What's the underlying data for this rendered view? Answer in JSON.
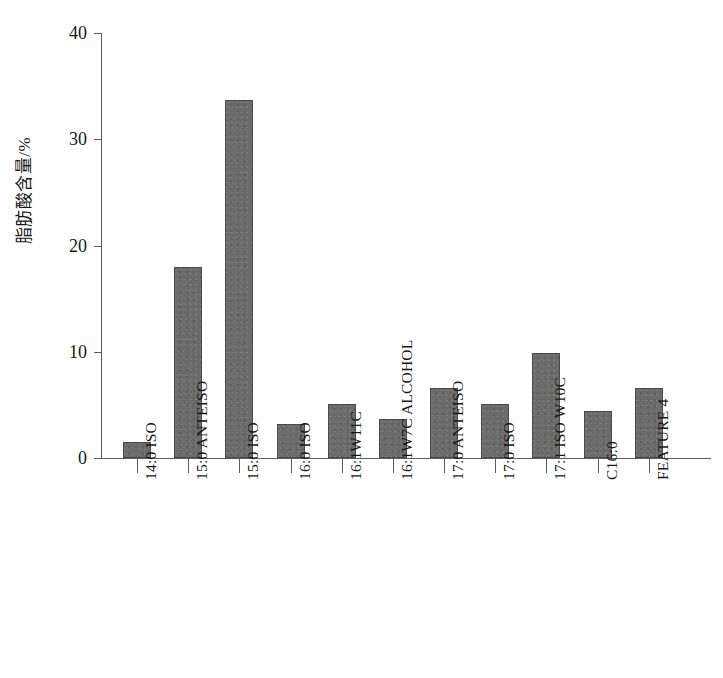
{
  "chart_data": {
    "type": "bar",
    "title": "",
    "xlabel": "",
    "ylabel": "脂肪酸含量/%",
    "ylim": [
      0,
      40
    ],
    "yticks": [
      0,
      10,
      20,
      30,
      40
    ],
    "grid": false,
    "legend": null,
    "bar_color": "#6b6b6b",
    "axis_color": "#5c5c5c",
    "background_color": "#ffffff",
    "categories": [
      "14:0 ISO",
      "15:0 ANTEISO",
      "15:0 ISO",
      "16:0 ISO",
      "16:1W11C",
      "16:1W7C ALCOHOL",
      "17:0 ANTEISO",
      "17:0 ISO",
      "17:1 ISO W10C",
      "C16:0",
      "FEATURE 4"
    ],
    "values": [
      1.5,
      18.0,
      33.7,
      3.2,
      5.1,
      3.7,
      6.6,
      5.1,
      9.9,
      4.4,
      6.6
    ]
  }
}
